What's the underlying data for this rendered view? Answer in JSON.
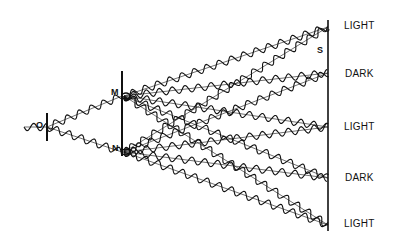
{
  "diagram": {
    "source": {
      "label": "O",
      "x": 47,
      "y": 127,
      "barrier_top": 113,
      "barrier_bottom": 141
    },
    "slit_barrier": {
      "x": 122,
      "top": 71,
      "bottom": 156
    },
    "slits": [
      {
        "label": "M",
        "x": 122,
        "y": 96
      },
      {
        "label": "N",
        "x": 122,
        "y": 152
      }
    ],
    "screen": {
      "label": "S",
      "x": 328,
      "top": 20,
      "bottom": 231
    },
    "fringes": [
      {
        "label": "LIGHT",
        "y": 27
      },
      {
        "label": "DARK",
        "y": 73
      },
      {
        "label": "LIGHT",
        "y": 127
      },
      {
        "label": "DARK",
        "y": 178
      },
      {
        "label": "LIGHT",
        "y": 225
      }
    ],
    "wave": {
      "wavelength": 13,
      "amplitude": 3.6,
      "color": "#111111"
    }
  }
}
